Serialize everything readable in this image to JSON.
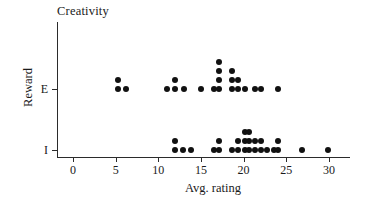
{
  "chart_data": {
    "type": "scatter",
    "title": "Creativity",
    "xlabel": "Avg. rating",
    "ylabel": "Reward",
    "xticks": [
      0,
      5,
      10,
      15,
      20,
      25,
      30
    ],
    "xlim": [
      -2,
      32
    ],
    "ycategories": [
      "I",
      "E"
    ],
    "grid": false,
    "legend": "none",
    "note": "Dot plot: each dot is one observation, stacked vertically where values repeat.",
    "series": [
      {
        "name": "E",
        "y": "E",
        "values": [
          5.3,
          5.3,
          6.2,
          11.0,
          12.0,
          12.0,
          13.0,
          15.0,
          16.5,
          17.1,
          17.1,
          17.1,
          17.1,
          18.6,
          18.6,
          18.6,
          19.3,
          19.3,
          20.2,
          21.3,
          22.0,
          24.0
        ]
      },
      {
        "name": "I",
        "y": "I",
        "values": [
          12.0,
          12.0,
          12.9,
          13.8,
          16.5,
          17.1,
          17.1,
          18.6,
          19.3,
          19.3,
          20.2,
          20.2,
          20.2,
          20.6,
          20.6,
          20.6,
          21.3,
          21.3,
          22.0,
          22.0,
          22.8,
          23.6,
          24.0,
          24.0,
          26.8,
          29.9
        ]
      }
    ]
  }
}
